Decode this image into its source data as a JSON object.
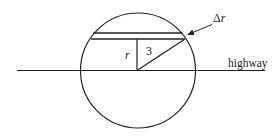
{
  "diagram": {
    "type": "geometry",
    "colors": {
      "line": "#222222",
      "background": "#ffffff"
    },
    "labels": {
      "radius": "3",
      "height": "r",
      "strip_width_delta": "Δ",
      "strip_width_var": "r",
      "highway": "highway"
    },
    "geometry": {
      "circle": {
        "cx": 138,
        "cy": 70.5,
        "r": 57.5
      },
      "highway": {
        "x1": 17,
        "x2": 265,
        "y": 70.5
      },
      "strip_upper_y": 33,
      "strip_lower_y": 39,
      "center": {
        "x": 137,
        "y": 70.5
      },
      "chord_right_point": {
        "x": 185,
        "y": 39
      },
      "arrow": {
        "from": {
          "x": 213,
          "y": 25
        },
        "to": {
          "x": 187,
          "y": 35
        }
      }
    }
  }
}
